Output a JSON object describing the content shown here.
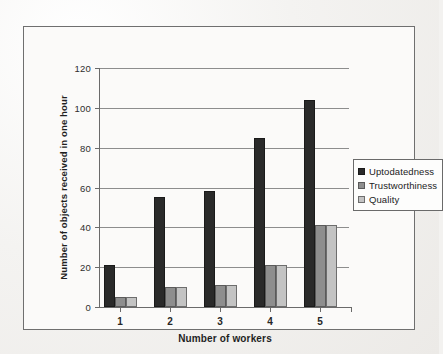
{
  "chart_data": {
    "type": "bar",
    "title": "",
    "xlabel": "Number of workers",
    "ylabel": "Number of objects received in one hour",
    "categories": [
      "1",
      "2",
      "3",
      "4",
      "5"
    ],
    "ylim": [
      0,
      120
    ],
    "yticks": [
      0,
      20,
      40,
      60,
      80,
      100,
      120
    ],
    "ytick_labels": [
      "0",
      "20",
      "40",
      "60",
      "80",
      "100",
      "120"
    ],
    "grid": true,
    "legend_position": "right",
    "series": [
      {
        "name": "Uptodatedness",
        "color": "#2a2a2a",
        "values": [
          21,
          55,
          58,
          85,
          104
        ]
      },
      {
        "name": "Trustworthiness",
        "color": "#8e8e8e",
        "values": [
          5,
          10,
          11,
          21,
          41
        ]
      },
      {
        "name": "Quality",
        "color": "#c3c3c3",
        "values": [
          5,
          10,
          11,
          21,
          41
        ]
      }
    ]
  }
}
